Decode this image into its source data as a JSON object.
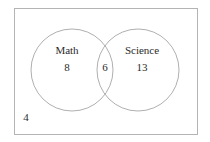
{
  "diagram": {
    "type": "venn",
    "title_visible": false,
    "universe": {
      "name": "universal-set-rectangle",
      "outside_count": "4"
    },
    "sets": [
      {
        "key": "math",
        "label": "Math",
        "only_count": "8",
        "label_x": 67,
        "label_y": 50,
        "count_x": 67,
        "count_y": 67
      },
      {
        "key": "science",
        "label": "Science",
        "only_count": "13",
        "label_x": 142,
        "label_y": 50,
        "count_x": 142,
        "count_y": 67
      }
    ],
    "intersection": {
      "label": "",
      "count": "6",
      "count_x": 105,
      "count_y": 67
    },
    "geometry": {
      "rect": {
        "x": 14,
        "y": 8,
        "width": 184,
        "height": 127
      },
      "left_circle": {
        "cx": 72,
        "cy": 70,
        "r": 41
      },
      "right_circle": {
        "cx": 138,
        "cy": 70,
        "r": 41
      }
    },
    "style": {
      "background": "#ffffff",
      "stroke": "#9a9a9a",
      "rect_stroke": "#b4b4b4",
      "text_color": "#2b2b2b",
      "fill": "none",
      "stroke_width": "0.8"
    }
  }
}
